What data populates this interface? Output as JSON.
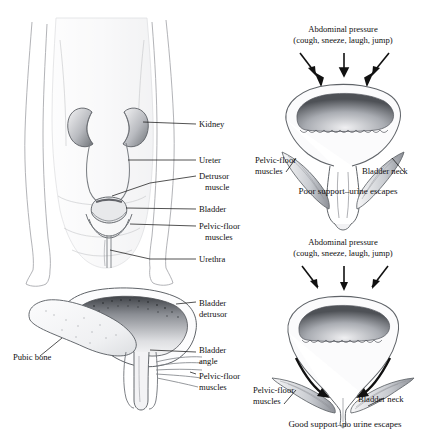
{
  "figure": {
    "background": "#ffffff",
    "ink": "#1a1a1a",
    "panels": [
      {
        "id": "torso-urinary-tract",
        "name": "anterior-torso-urinary-system",
        "labels": [
          {
            "key": "kidney",
            "text": "Kidney"
          },
          {
            "key": "ureter",
            "text": "Ureter"
          },
          {
            "key": "detrusor_1",
            "text": "Detrusor"
          },
          {
            "key": "detrusor_2",
            "text": "muscle"
          },
          {
            "key": "bladder",
            "text": "Bladder"
          },
          {
            "key": "pelvic_floor_1",
            "text": "Pelvic-floor"
          },
          {
            "key": "pelvic_floor_2",
            "text": "muscles"
          },
          {
            "key": "urethra",
            "text": "Urethra"
          }
        ]
      },
      {
        "id": "sagittal-bladder",
        "name": "sagittal-bladder-pubic-bone",
        "labels": [
          {
            "key": "bladder_detrusor_1",
            "text": "Bladder"
          },
          {
            "key": "bladder_detrusor_2",
            "text": "detrusor"
          },
          {
            "key": "bladder_angle_1",
            "text": "Bladder"
          },
          {
            "key": "bladder_angle_2",
            "text": "angle"
          },
          {
            "key": "pelvic_floor_1",
            "text": "Pelvic-floor"
          },
          {
            "key": "pelvic_floor_2",
            "text": "muscles"
          },
          {
            "key": "pubic_bone",
            "text": "Pubic bone"
          }
        ]
      },
      {
        "id": "poor-support",
        "name": "poor-support-bladder",
        "heading_line1": "Abdominal pressure",
        "heading_line2": "(cough, sneeze, laugh, jump)",
        "caption": "Poor support–urine escapes",
        "labels": [
          {
            "key": "pelvic_floor_1",
            "text": "Pelvic-floor"
          },
          {
            "key": "pelvic_floor_2",
            "text": "muscles"
          },
          {
            "key": "bladder_neck",
            "text": "Bladder neck"
          }
        ],
        "arrows": 3,
        "arrow_style": "straight-down"
      },
      {
        "id": "good-support",
        "name": "good-support-bladder",
        "heading_line1": "Abdominal pressure",
        "heading_line2": "(cough, sneeze, laugh, jump)",
        "caption": "Good support–no urine escapes",
        "labels": [
          {
            "key": "pelvic_floor_1",
            "text": "Pelvic-floor"
          },
          {
            "key": "pelvic_floor_2",
            "text": "muscles"
          },
          {
            "key": "bladder_neck",
            "text": "Bladder neck"
          }
        ],
        "arrows": 3,
        "arrow_style": "straight-down-plus-curved-support"
      }
    ]
  }
}
